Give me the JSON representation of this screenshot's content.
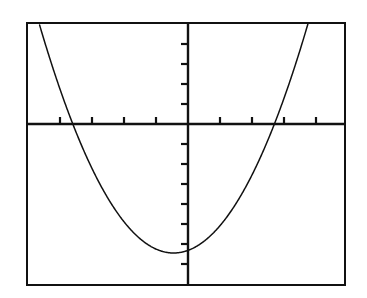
{
  "screen": {
    "title": "Graphing calculator display",
    "background_color": "#ffffff",
    "ink_color": "#111111",
    "frame_label": "calculator-screen-border"
  },
  "chart_data": {
    "type": "line",
    "title": "",
    "subtitle": "",
    "xlabel": "",
    "ylabel": "",
    "grid": false,
    "legend": null,
    "legend_position": "none",
    "axis_style": "centered-cross-with-ticks",
    "xlim": [
      -5.0,
      4.9
    ],
    "ylim": [
      -7.85,
      5.05
    ],
    "xtick_step": 1,
    "ytick_step": 1,
    "xticks": [
      -5,
      -4,
      -3,
      -2,
      -1,
      1,
      2,
      3,
      4
    ],
    "yticks": [
      -7,
      -6,
      -5,
      -4,
      -3,
      -2,
      -1,
      1,
      2,
      3,
      4,
      5
    ],
    "xtick_labels": [],
    "ytick_labels": [],
    "series": [
      {
        "name": "parabola",
        "equation": "y = 0.64x^2 + 0.58x - 6.32",
        "orientation": "opens-upward",
        "color": "#111111",
        "vertex": [
          -0.45,
          -6.45
        ],
        "x_intercepts": [
          -3.6,
          2.7
        ],
        "y_intercept": -6.32,
        "x": [
          -4.8,
          -4.4,
          -4.0,
          -3.6,
          -3.2,
          -2.8,
          -2.4,
          -2.0,
          -1.6,
          -1.2,
          -0.8,
          -0.45,
          0.0,
          0.4,
          0.8,
          1.2,
          1.6,
          2.0,
          2.4,
          2.8,
          3.2,
          3.6,
          3.9
        ],
        "y": [
          5.6,
          3.5,
          1.6,
          -0.1,
          -1.6,
          -2.9,
          -4.0,
          -4.9,
          -5.6,
          -6.1,
          -6.4,
          -6.45,
          -6.32,
          -5.99,
          -5.45,
          -4.7,
          -3.75,
          -2.6,
          -1.24,
          -0.33,
          2.09,
          4.06,
          5.4
        ]
      }
    ]
  },
  "geometry": {
    "frame_px": {
      "left": 26,
      "top": 22,
      "width": 320,
      "height": 264
    },
    "origin_px": {
      "x": 188,
      "y": 124
    },
    "x_unit_px": 32,
    "y_unit_px": 20,
    "vertex_px": {
      "x": 178,
      "y": 250
    },
    "x_intercept_left_px": 95,
    "x_intercept_right_px": 252,
    "tick_length_px": 7
  }
}
